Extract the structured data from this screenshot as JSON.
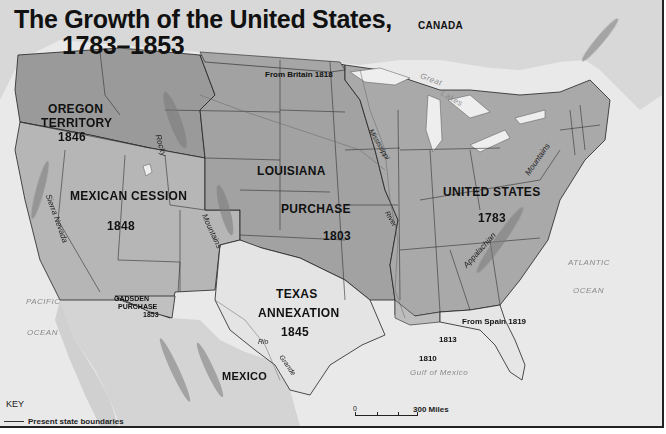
{
  "map": {
    "title_line1": "The Growth of the United States,",
    "title_line2": "1783–1853",
    "colors": {
      "ocean": "#e9e9e9",
      "foreign_land": "#d8d8d8",
      "us_1783": "#a9a9a9",
      "louisiana": "#a2a2a2",
      "oregon": "#9a9a9a",
      "mexican_cession": "#b6b6b6",
      "texas": "#e4e4e4",
      "gadsden": "#c0c0c0",
      "florida": "#e6e6e6",
      "lakes": "#eeeeee",
      "border": "#222222"
    },
    "territories": [
      {
        "name": "UNITED STATES",
        "year": "1783"
      },
      {
        "name": "LOUISIANA PURCHASE",
        "year": "1803"
      },
      {
        "name": "OREGON TERRITORY",
        "year": "1846"
      },
      {
        "name": "MEXICAN CESSION",
        "year": "1848"
      },
      {
        "name": "TEXAS ANNEXATION",
        "year": "1845"
      },
      {
        "name": "GADSDEN PURCHASE",
        "year": "1853"
      },
      {
        "name": "From Britain",
        "year": "1818"
      },
      {
        "name": "From Spain",
        "year": "1819"
      },
      {
        "name": "",
        "year": "1810"
      },
      {
        "name": "",
        "year": "1813"
      }
    ],
    "labels": {
      "canada": "CANADA",
      "mexico": "MEXICO",
      "oregon_1": "OREGON",
      "oregon_2": "TERRITORY",
      "oregon_year": "1846",
      "louisiana_1": "LOUISIANA",
      "louisiana_2": "PURCHASE",
      "louisiana_year": "1803",
      "mexican_cession": "MEXICAN CESSION",
      "mexican_cession_year": "1848",
      "us": "UNITED STATES",
      "us_year": "1783",
      "texas_1": "TEXAS",
      "texas_2": "ANNEXATION",
      "texas_year": "1845",
      "gadsden_1": "GADSDEN",
      "gadsden_2": "PURCHASE",
      "gadsden_year": "1853",
      "from_britain": "From Britain  1818",
      "from_spain": "From Spain  1819",
      "year_1810": "1810",
      "year_1813": "1813"
    },
    "water_labels": {
      "pacific": "PACIFIC",
      "pacific_ocean": "OCEAN",
      "atlantic": "ATLANTIC",
      "atlantic_ocean": "OCEAN",
      "gulf": "Gulf of Mexico",
      "great": "Great",
      "lakes": "Lakes"
    },
    "features": {
      "rocky": "Rocky",
      "mountains_west": "Mountains",
      "sierra_nevada": "Sierra Nevada",
      "mississippi": "Mississippi",
      "river": "River",
      "appalachian": "Appalachian",
      "mountains_east": "Mountains",
      "rio": "Rio",
      "grande": "Grande"
    },
    "key": {
      "title": "KEY",
      "item": "Present state boundaries"
    },
    "scale": {
      "zero": "0",
      "label": "300 Miles"
    }
  }
}
